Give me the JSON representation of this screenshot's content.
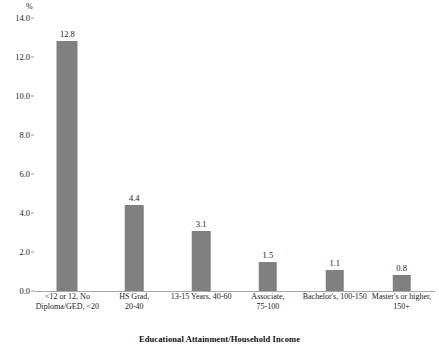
{
  "chart_data": {
    "type": "bar",
    "title": "",
    "xlabel": "Educational Attainment/Household Income",
    "ylabel": "%",
    "ylim": [
      0,
      14
    ],
    "ytick_step": 2,
    "ytick_labels": [
      "0.0",
      "2.0",
      "4.0",
      "6.0",
      "8.0",
      "10.0",
      "12.0",
      "14.0"
    ],
    "ytick_values": [
      0,
      2,
      4,
      6,
      8,
      10,
      12,
      14
    ],
    "grid": false,
    "legend": "none",
    "bar_color": "#808080",
    "categories": [
      "<12 or 12, No Diploma/GED, <20",
      "HS Grad, 20-40",
      "13-15 Years, 40-60",
      "Associate, 75-100",
      "Bachelor's, 100-150",
      "Master's or higher, 150+"
    ],
    "category_lines": [
      [
        "<12 or 12, No",
        "Diploma/GED, <20"
      ],
      [
        "HS Grad,",
        "20-40"
      ],
      [
        "13-15 Years, 40-60"
      ],
      [
        "Associate,",
        "75-100"
      ],
      [
        "Bachelor's, 100-150"
      ],
      [
        "Master's or higher,",
        "150+"
      ]
    ],
    "values": [
      12.8,
      4.4,
      3.1,
      1.5,
      1.1,
      0.8
    ],
    "value_labels": [
      "12.8",
      "4.4",
      "3.1",
      "1.5",
      "1.1",
      "0.8"
    ]
  }
}
